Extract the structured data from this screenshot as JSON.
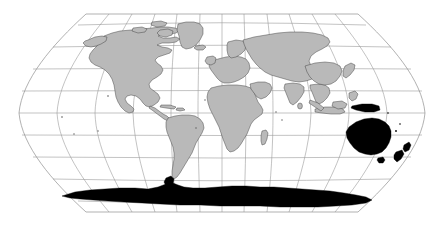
{
  "figure": {
    "kind": "world-map",
    "title": "",
    "projection": "Robinson",
    "background_color": "#ffffff",
    "width": 444,
    "height": 226
  },
  "map": {
    "bounds": {
      "left": 19,
      "right": 425,
      "top": 14,
      "bottom": 212
    },
    "center_longitude": 0,
    "land_fill_color": "#b9b9b9",
    "land_outline_color": "#3a3a3a",
    "highlight_fill_color": "#000000",
    "graticule_color": "#9a9a9a",
    "outline_color": "#8f8f8f"
  },
  "graticule": {
    "meridian_interval_degrees": 30,
    "parallel_interval_degrees": 20,
    "meridians": [
      -180,
      -150,
      -120,
      -90,
      -60,
      -30,
      0,
      30,
      60,
      90,
      120,
      150,
      180
    ],
    "parallels": [
      80,
      60,
      40,
      20,
      0,
      -20,
      -40,
      -60,
      -80
    ],
    "show_equator": true,
    "show_border": true
  },
  "legend": {
    "visible": false,
    "entries": [
      {
        "label": "Highlighted region",
        "color": "#000000"
      },
      {
        "label": "Other land",
        "color": "#b9b9b9"
      }
    ]
  },
  "regions": {
    "highlighted": [
      "Australia",
      "Tasmania",
      "New Zealand",
      "Antarctica",
      "New Guinea (partial)"
    ],
    "normal": [
      "North America",
      "Greenland",
      "South America",
      "Africa",
      "Europe",
      "Asia",
      "Madagascar",
      "Japan",
      "British Isles",
      "Indonesia",
      "Philippines",
      "Iceland",
      "Sri Lanka"
    ]
  },
  "labels": {
    "axis_x": "",
    "axis_y": "",
    "caption": ""
  }
}
